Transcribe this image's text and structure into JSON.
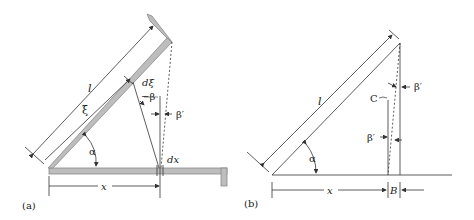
{
  "figure": {
    "panel_a": {
      "caption": "(a)",
      "labels": {
        "length": "l",
        "xi": "ξ",
        "d_xi": "dξ",
        "neg_beta": "−β",
        "beta_prime": "β′",
        "alpha": "α",
        "dx": "dx",
        "x": "x"
      }
    },
    "panel_b": {
      "caption": "(b)",
      "labels": {
        "length": "l",
        "c": "C",
        "beta_prime_top": "β′",
        "beta_prime_mid": "β′",
        "alpha": "α",
        "x": "x",
        "b": "B"
      }
    },
    "colors": {
      "line": "#333333",
      "plate_fill": "#bdbdbd",
      "plate_edge": "#8a8a8a"
    }
  }
}
